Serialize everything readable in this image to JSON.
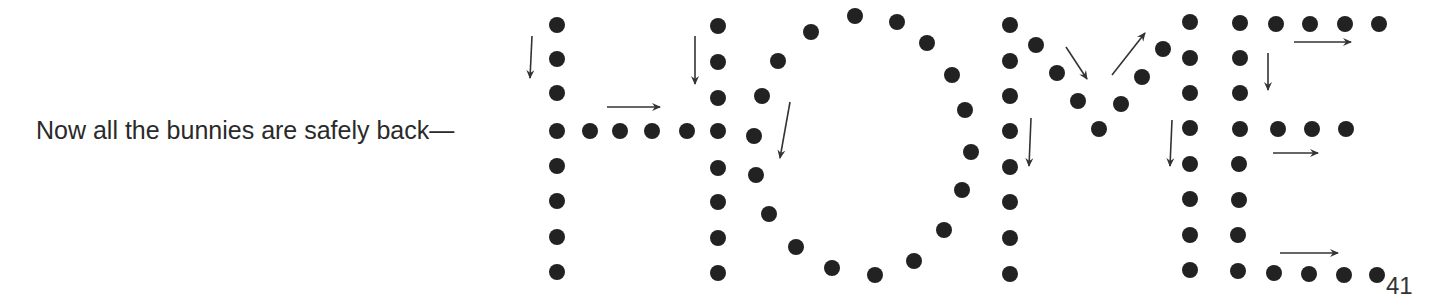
{
  "puzzle": {
    "caption": "Now all the bunnies are safely back—",
    "hidden_word": "HOME",
    "page_number": "41",
    "dot_color": "#222222",
    "arrow_color": "#333333",
    "dot_radius": 8
  },
  "letters": {
    "H": {
      "dots": [
        [
          557,
          25
        ],
        [
          557,
          59
        ],
        [
          557,
          93
        ],
        [
          557,
          131
        ],
        [
          557,
          166
        ],
        [
          557,
          201
        ],
        [
          557,
          237
        ],
        [
          557,
          272
        ],
        [
          590,
          131
        ],
        [
          620,
          131
        ],
        [
          652,
          131
        ],
        [
          687,
          131
        ],
        [
          718,
          26
        ],
        [
          718,
          62
        ],
        [
          718,
          98
        ],
        [
          718,
          131
        ],
        [
          718,
          168
        ],
        [
          718,
          202
        ],
        [
          718,
          238
        ],
        [
          718,
          273
        ]
      ],
      "arrows": [
        {
          "x1": 532,
          "y1": 36,
          "x2": 530,
          "y2": 78
        },
        {
          "x1": 607,
          "y1": 107,
          "x2": 660,
          "y2": 107
        },
        {
          "x1": 695,
          "y1": 36,
          "x2": 695,
          "y2": 84
        }
      ]
    },
    "O": {
      "dots": [
        [
          811,
          32
        ],
        [
          778,
          61
        ],
        [
          762,
          96
        ],
        [
          754,
          136
        ],
        [
          756,
          175
        ],
        [
          769,
          214
        ],
        [
          796,
          247
        ],
        [
          832,
          268
        ],
        [
          875,
          275
        ],
        [
          914,
          261
        ],
        [
          944,
          230
        ],
        [
          962,
          190
        ],
        [
          971,
          152
        ],
        [
          965,
          110
        ],
        [
          952,
          75
        ],
        [
          927,
          43
        ],
        [
          897,
          22
        ],
        [
          855,
          16
        ]
      ],
      "arrows": [
        {
          "x1": 790,
          "y1": 102,
          "x2": 780,
          "y2": 158
        }
      ]
    },
    "M": {
      "dots": [
        [
          1010,
          25
        ],
        [
          1010,
          61
        ],
        [
          1010,
          96
        ],
        [
          1010,
          131
        ],
        [
          1010,
          167
        ],
        [
          1010,
          202
        ],
        [
          1010,
          238
        ],
        [
          1010,
          274
        ],
        [
          1036,
          45
        ],
        [
          1057,
          73
        ],
        [
          1078,
          101
        ],
        [
          1099,
          129
        ],
        [
          1121,
          104
        ],
        [
          1142,
          77
        ],
        [
          1163,
          49
        ],
        [
          1190,
          22
        ],
        [
          1190,
          58
        ],
        [
          1190,
          93
        ],
        [
          1190,
          128
        ],
        [
          1190,
          164
        ],
        [
          1190,
          199
        ],
        [
          1190,
          235
        ],
        [
          1190,
          270
        ]
      ],
      "arrows": [
        {
          "x1": 1031,
          "y1": 118,
          "x2": 1029,
          "y2": 166
        },
        {
          "x1": 1066,
          "y1": 47,
          "x2": 1087,
          "y2": 79
        },
        {
          "x1": 1112,
          "y1": 75,
          "x2": 1145,
          "y2": 33
        },
        {
          "x1": 1172,
          "y1": 120,
          "x2": 1170,
          "y2": 166
        }
      ]
    },
    "E": {
      "dots": [
        [
          1240,
          23
        ],
        [
          1276,
          24
        ],
        [
          1310,
          24
        ],
        [
          1345,
          24
        ],
        [
          1379,
          24
        ],
        [
          1240,
          58
        ],
        [
          1240,
          93
        ],
        [
          1240,
          129
        ],
        [
          1278,
          129
        ],
        [
          1312,
          129
        ],
        [
          1346,
          129
        ],
        [
          1239,
          164
        ],
        [
          1239,
          200
        ],
        [
          1238,
          235
        ],
        [
          1238,
          271
        ],
        [
          1274,
          273
        ],
        [
          1309,
          274
        ],
        [
          1344,
          275
        ],
        [
          1377,
          275
        ]
      ],
      "arrows": [
        {
          "x1": 1294,
          "y1": 42,
          "x2": 1351,
          "y2": 42
        },
        {
          "x1": 1268,
          "y1": 53,
          "x2": 1268,
          "y2": 90
        },
        {
          "x1": 1273,
          "y1": 153,
          "x2": 1318,
          "y2": 153
        },
        {
          "x1": 1280,
          "y1": 253,
          "x2": 1338,
          "y2": 253
        }
      ]
    }
  }
}
